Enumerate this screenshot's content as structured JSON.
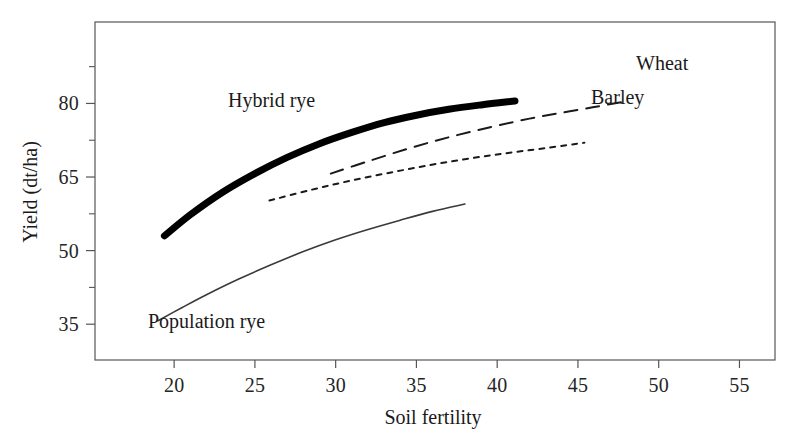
{
  "chart_data": {
    "type": "line",
    "title": "",
    "xlabel": "Soil fertility",
    "ylabel": "Yield (dt/ha)",
    "xlim": [
      15.1,
      57.2
    ],
    "ylim": [
      27.7,
      96.6
    ],
    "grid": false,
    "legend_position": "inline-labels",
    "x_major_ticks": [
      20,
      25,
      30,
      35,
      40,
      45,
      50,
      55
    ],
    "x_tick_labels": [
      "20",
      "25",
      "30",
      "35",
      "40",
      "45",
      "50",
      "55"
    ],
    "y_major_ticks": [
      35,
      50,
      65,
      80
    ],
    "y_tick_labels": [
      "35",
      "50",
      "65",
      "80"
    ],
    "y_minor_ticks": [
      27.5,
      42.5,
      57.5,
      72.5,
      87.5
    ],
    "series": [
      {
        "name": "Hybrid rye",
        "style": "solid-thick",
        "color": "#000000",
        "width": 7,
        "label": "Hybrid rye",
        "points": [
          [
            19.4,
            53.0
          ],
          [
            21.0,
            57.3
          ],
          [
            23.0,
            61.9
          ],
          [
            25.0,
            65.7
          ],
          [
            27.0,
            69.0
          ],
          [
            29.0,
            71.8
          ],
          [
            31.0,
            74.1
          ],
          [
            33.0,
            76.1
          ],
          [
            35.0,
            77.6
          ],
          [
            37.0,
            78.8
          ],
          [
            39.0,
            79.7
          ],
          [
            41.1,
            80.5
          ]
        ]
      },
      {
        "name": "Wheat",
        "style": "dashed",
        "color": "#1a1a1a",
        "width": 2,
        "label": "Wheat",
        "points": [
          [
            29.7,
            65.7
          ],
          [
            32.0,
            68.2
          ],
          [
            34.5,
            70.8
          ],
          [
            37.0,
            73.1
          ],
          [
            39.5,
            75.1
          ],
          [
            42.0,
            76.9
          ],
          [
            44.5,
            78.4
          ],
          [
            47.8,
            80.3
          ]
        ]
      },
      {
        "name": "Barley",
        "style": "dotted",
        "color": "#1a1a1a",
        "width": 2,
        "label": "Barley",
        "points": [
          [
            25.9,
            60.2
          ],
          [
            28.5,
            62.4
          ],
          [
            31.0,
            64.3
          ],
          [
            34.0,
            66.3
          ],
          [
            37.0,
            68.1
          ],
          [
            40.0,
            69.6
          ],
          [
            43.0,
            70.9
          ],
          [
            45.4,
            72.0
          ]
        ]
      },
      {
        "name": "Population rye",
        "style": "solid-thin",
        "color": "#3a3a3a",
        "width": 1.6,
        "label": "Population rye",
        "points": [
          [
            19.0,
            35.7
          ],
          [
            20.5,
            38.4
          ],
          [
            22.0,
            41.0
          ],
          [
            24.0,
            44.2
          ],
          [
            26.0,
            47.1
          ],
          [
            28.0,
            49.8
          ],
          [
            30.0,
            52.2
          ],
          [
            32.0,
            54.3
          ],
          [
            34.0,
            56.2
          ],
          [
            36.0,
            58.0
          ],
          [
            38.0,
            59.5
          ]
        ]
      }
    ]
  },
  "axes": {
    "x_title": "Soil fertility",
    "y_title": "Yield (dt/ha)",
    "frame_color": "#555555"
  },
  "labels": {
    "hybrid_rye": "Hybrid rye",
    "population_rye": "Population rye",
    "wheat": "Wheat",
    "barley": "Barley"
  },
  "xticks": [
    {
      "value": 20,
      "text": "20"
    },
    {
      "value": 25,
      "text": "25"
    },
    {
      "value": 30,
      "text": "30"
    },
    {
      "value": 35,
      "text": "35"
    },
    {
      "value": 40,
      "text": "40"
    },
    {
      "value": 45,
      "text": "45"
    },
    {
      "value": 50,
      "text": "50"
    },
    {
      "value": 55,
      "text": "55"
    }
  ],
  "yticks": [
    {
      "value": 35,
      "text": "35"
    },
    {
      "value": 50,
      "text": "50"
    },
    {
      "value": 65,
      "text": "65"
    },
    {
      "value": 80,
      "text": "80"
    }
  ]
}
